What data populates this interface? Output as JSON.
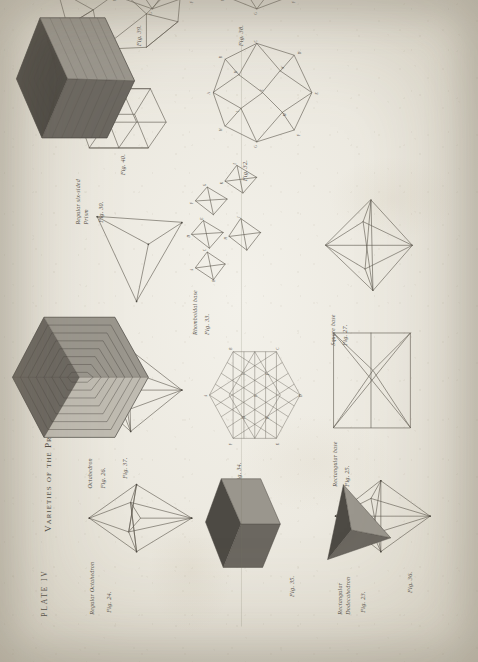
{
  "document": {
    "plate_number": "PLATE IV",
    "title": "Varieties of the Primitive Forms",
    "engraver_credit": "Engraved",
    "medium": "copperplate engraving on laid paper"
  },
  "figures": [
    {
      "id": "fig24",
      "fig_label": "Fig. 24.",
      "name": "Regular Octahedron",
      "kind": "wireframe-octahedron"
    },
    {
      "id": "fig23",
      "fig_label": "Fig. 23.",
      "name": "Rectangular Dodecahedron",
      "kind": "wireframe-octahedron"
    },
    {
      "id": "fig25",
      "fig_label": "Fig. 25.",
      "name": "Rectangular base",
      "kind": "wireframe-pyramid-rect"
    },
    {
      "id": "fig26",
      "fig_label": "Fig. 26.",
      "name": "Octahedron",
      "kind": "wireframe-octahedron-wide"
    },
    {
      "id": "fig27",
      "fig_label": "Fig. 27.",
      "name": "Square base",
      "kind": "wireframe-pyramid-square"
    },
    {
      "id": "fig28",
      "fig_label": "Fig. 28.",
      "name": "Tetrahedron",
      "kind": "wireframe-tetrahedron"
    },
    {
      "id": "fig30",
      "fig_label": "Fig. 30.",
      "name": "Regular six-sided Prism",
      "kind": "wireframe-hex-prism"
    },
    {
      "id": "fig31",
      "fig_label": "Fig. 31.",
      "name": "Rhomboidal Dodecahedron",
      "kind": "wireframe-rhombic-dodeca"
    },
    {
      "id": "fig33",
      "fig_label": "Fig. 33.",
      "name": "Rhomboidal base",
      "kind": "wireframe-cluster"
    },
    {
      "id": "fig32",
      "fig_label": "Fig. 32.",
      "name": "",
      "kind": "wireframe-lettered-polyhedron"
    },
    {
      "id": "fig34",
      "fig_label": "Fig. 34.",
      "name": "",
      "kind": "hexagonal-lattice"
    },
    {
      "id": "fig35",
      "fig_label": "Fig. 35.",
      "name": "",
      "kind": "shaded-cube"
    },
    {
      "id": "fig36",
      "fig_label": "Fig. 36.",
      "name": "",
      "kind": "shaded-tetrahedron"
    },
    {
      "id": "fig37",
      "fig_label": "Fig. 37.",
      "name": "",
      "kind": "stepped-pyramid-hex"
    },
    {
      "id": "fig38",
      "fig_label": "Fig. 38.",
      "name": "",
      "kind": "wireframe-lettered-polyhedron"
    },
    {
      "id": "fig39",
      "fig_label": "Fig. 39.",
      "name": "",
      "kind": "wireframe-lettered-polyhedron"
    },
    {
      "id": "fig40",
      "fig_label": "Fig. 40.",
      "name": "",
      "kind": "stepped-cube"
    }
  ],
  "vertex_letters": [
    "A",
    "B",
    "C",
    "D",
    "E",
    "F",
    "G",
    "H",
    "I",
    "K",
    "L",
    "M",
    "N",
    "O",
    "P",
    "Q",
    "R",
    "S"
  ],
  "colors": {
    "paper": "#ece9e0",
    "ink": "#57534c",
    "shade_dark": "#6b6760",
    "shade_mid": "#9a968d",
    "shade_light": "#bfbbb1",
    "shade_darkest": "#4d4a44",
    "background": "#8d8d8b"
  }
}
